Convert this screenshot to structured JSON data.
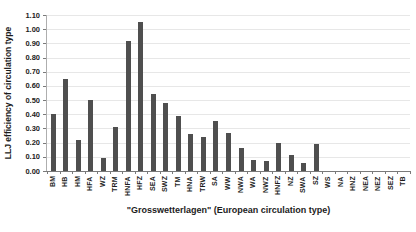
{
  "chart_data": {
    "type": "bar",
    "title": "",
    "xlabel": "\"Grosswetterlagen\" (European circulation type)",
    "ylabel": "LLJ efficiency of circulation type",
    "categories": [
      "BM",
      "HB",
      "HM",
      "HFA",
      "WZ",
      "TRM",
      "HNFA",
      "HFZ",
      "SEA",
      "SWZ",
      "TM",
      "HNA",
      "TRW",
      "SA",
      "WW",
      "NWA",
      "WA",
      "NWZ",
      "HNFZ",
      "NZ",
      "SWA",
      "SZ",
      "WS",
      "NA",
      "HNZ",
      "NEA",
      "NEZ",
      "SEZ",
      "TB"
    ],
    "values": [
      0.4,
      0.65,
      0.22,
      0.5,
      0.09,
      0.31,
      0.92,
      1.05,
      0.54,
      0.48,
      0.39,
      0.26,
      0.24,
      0.35,
      0.27,
      0.16,
      0.08,
      0.07,
      0.2,
      0.11,
      0.06,
      0.19,
      0,
      0,
      0,
      0,
      0,
      0,
      0
    ],
    "ylim": [
      0,
      1.1
    ],
    "ytick_step": 0.1,
    "ytick_format_decimals": 2,
    "grid": true,
    "legend": null,
    "bar_color": "#4f4f4f",
    "gridline_color": "#e7e7e7",
    "axis_color": "#7a7a7a",
    "text_color": "#1c1c1c",
    "background_color": "#ffffff"
  }
}
